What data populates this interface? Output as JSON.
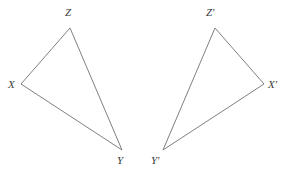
{
  "figure": {
    "type": "geometry-diagram",
    "background_color": "#ffffff",
    "stroke_color": "#808080",
    "stroke_width": 1,
    "label_color": "#3a3a3a",
    "canvas": {
      "width": 287,
      "height": 172
    },
    "shapes": [
      {
        "name": "triangle-xyz",
        "vertices": [
          {
            "label": "X",
            "x": 21,
            "y": 84,
            "label_x": 8,
            "label_y": 79
          },
          {
            "label": "Y",
            "x": 122,
            "y": 150,
            "label_x": 117,
            "label_y": 155
          },
          {
            "label": "Z",
            "x": 70,
            "y": 28,
            "label_x": 65,
            "label_y": 7
          }
        ]
      },
      {
        "name": "triangle-xyz-prime",
        "vertices": [
          {
            "label": "X'",
            "x": 264,
            "y": 84,
            "label_x": 268,
            "label_y": 79
          },
          {
            "label": "Y'",
            "x": 163,
            "y": 150,
            "label_x": 151,
            "label_y": 155
          },
          {
            "label": "Z'",
            "x": 215,
            "y": 28,
            "label_x": 206,
            "label_y": 7
          }
        ]
      }
    ]
  }
}
